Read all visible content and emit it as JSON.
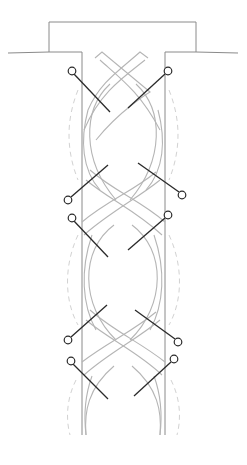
{
  "diagram": {
    "colors": {
      "outline": "#8a8a8a",
      "strand": "#b5b5b5",
      "dashed_guide": "#d2d2d2",
      "pin": "#2a2a2a",
      "background": "#ffffff"
    },
    "board": {
      "ground_line": {
        "x1": 8,
        "x2": 238,
        "y": 52
      },
      "top_block": {
        "x": 49,
        "y": 22,
        "width": 147,
        "height": 30
      },
      "column": {
        "x_left": 82,
        "x_right": 165,
        "y_top": 52,
        "y_bottom": 435
      }
    },
    "crossings_y": [
      62,
      195,
      335
    ],
    "pins": [
      {
        "id": "pin-1-left",
        "head": [
          72,
          71
        ],
        "tip": [
          110,
          112
        ]
      },
      {
        "id": "pin-1-right",
        "head": [
          168,
          71
        ],
        "tip": [
          128,
          108
        ]
      },
      {
        "id": "pin-2-left",
        "head": [
          68,
          200
        ],
        "tip": [
          108,
          165
        ]
      },
      {
        "id": "pin-2-right",
        "head": [
          182,
          195
        ],
        "tip": [
          138,
          163
        ]
      },
      {
        "id": "pin-3-left",
        "head": [
          72,
          218
        ],
        "tip": [
          108,
          257
        ]
      },
      {
        "id": "pin-3-right",
        "head": [
          168,
          215
        ],
        "tip": [
          128,
          250
        ]
      },
      {
        "id": "pin-4-left",
        "head": [
          68,
          340
        ],
        "tip": [
          107,
          305
        ]
      },
      {
        "id": "pin-4-right",
        "head": [
          178,
          342
        ],
        "tip": [
          135,
          310
        ]
      },
      {
        "id": "pin-5-left",
        "head": [
          71,
          361
        ],
        "tip": [
          108,
          399
        ]
      },
      {
        "id": "pin-5-right",
        "head": [
          174,
          359
        ],
        "tip": [
          134,
          396
        ]
      }
    ]
  }
}
